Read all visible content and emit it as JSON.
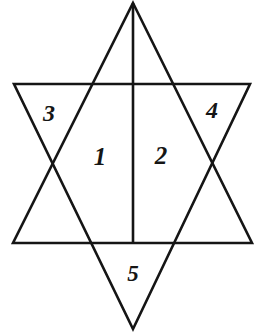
{
  "figure": {
    "type": "line-drawing",
    "canvas": {
      "width": 258,
      "height": 334
    },
    "background_color": "#ffffff",
    "stroke_color": "#151515",
    "stroke_width": 2.6,
    "shapes": [
      {
        "name": "upward-triangle",
        "points": "133,3 252,243 13,243",
        "description": "Large triangle pointing up"
      },
      {
        "name": "downward-triangle",
        "points": "14,84 250,84 133,329",
        "description": "Large triangle pointing down, overlapping to form a hexagram"
      },
      {
        "name": "center-vertical-line",
        "x1": 133,
        "y1": 3,
        "x2": 133,
        "y2": 243,
        "description": "Vertical bisector of the upward triangle from apex to base"
      }
    ],
    "vertices": {
      "apex": [
        133,
        3
      ],
      "base_left": [
        13,
        243
      ],
      "base_right": [
        252,
        243
      ],
      "inverted_top_left": [
        14,
        84
      ],
      "inverted_top_right": [
        250,
        84
      ],
      "bottom_point": [
        133,
        329
      ],
      "intersection_upper_left": [
        94,
        84
      ],
      "intersection_upper_right": [
        172,
        84
      ],
      "intersection_lower_left": [
        54,
        161
      ],
      "intersection_lower_right": [
        210,
        161
      ],
      "intersection_base_left": [
        93,
        243
      ],
      "intersection_base_right": [
        175,
        243
      ]
    },
    "labels": [
      {
        "name": "region-1",
        "text": "1",
        "x": 100,
        "y": 156,
        "region": "left half of central hexagon area"
      },
      {
        "name": "region-2",
        "text": "2",
        "x": 161,
        "y": 155,
        "region": "right half of central hexagon area"
      },
      {
        "name": "region-3",
        "text": "3",
        "x": 49,
        "y": 113,
        "region": "upper-left point of the star"
      },
      {
        "name": "region-4",
        "text": "4",
        "x": 212,
        "y": 110,
        "region": "upper-right point of the star"
      },
      {
        "name": "region-5",
        "text": "5",
        "x": 133,
        "y": 273,
        "region": "bottom point of the star"
      }
    ]
  }
}
